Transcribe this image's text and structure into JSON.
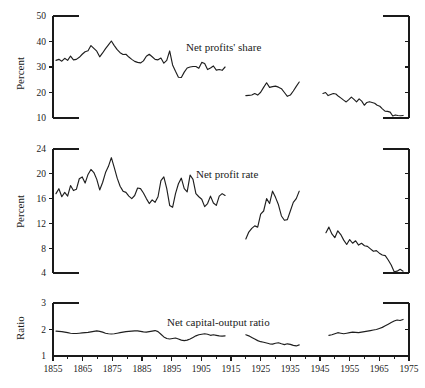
{
  "chart_data": {
    "type": "line",
    "title": "",
    "xlabel": "",
    "xlim": [
      1855,
      1975
    ],
    "x_ticks_major": [
      1855,
      1865,
      1875,
      1885,
      1895,
      1905,
      1915,
      1925,
      1935,
      1945,
      1955,
      1965,
      1975
    ],
    "x_ticks_minor": [
      1860,
      1870,
      1880,
      1890,
      1900,
      1910,
      1920,
      1930,
      1940,
      1950,
      1960,
      1970
    ],
    "grid": false,
    "legend": "inline-annotation",
    "panels": [
      {
        "name": "net-profits-share",
        "label": "Net profits' share",
        "ylabel": "Percent",
        "ylim": [
          10,
          50
        ],
        "y_ticks": [
          10,
          20,
          30,
          40,
          50
        ],
        "segments": [
          {
            "name": "1856-1913",
            "x_start": 1856,
            "x_end": 1913,
            "values": [
              32.6,
              33.0,
              32.3,
              33.4,
              32.6,
              34.3,
              32.8,
              33.0,
              33.8,
              35.0,
              36.0,
              36.4,
              38.4,
              37.3,
              36.2,
              34.0,
              35.5,
              37.2,
              38.7,
              40.2,
              38.4,
              36.8,
              35.6,
              34.9,
              35.0,
              33.9,
              33.0,
              32.2,
              31.8,
              31.6,
              32.4,
              34.2,
              35.0,
              34.0,
              33.0,
              32.8,
              33.5,
              31.5,
              32.6,
              36.3,
              30.8,
              28.3,
              26.0,
              25.9,
              28.0,
              29.6,
              30.0,
              30.2,
              30.2,
              29.5,
              31.8,
              31.4,
              29.0,
              29.6,
              30.4,
              28.8,
              29.0,
              28.7,
              30.0
            ]
          },
          {
            "name": "1920-1938",
            "x_start": 1920,
            "x_end": 1938,
            "values": [
              18.8,
              18.9,
              19.0,
              19.6,
              19.0,
              20.1,
              22.0,
              23.8,
              22.0,
              22.3,
              22.5,
              22.1,
              21.5,
              20.0,
              18.5,
              19.0,
              20.6,
              22.4,
              24.1
            ]
          },
          {
            "name": "1946-1973",
            "x_start": 1946,
            "x_end": 1973,
            "values": [
              19.6,
              20.0,
              18.8,
              19.2,
              19.6,
              19.4,
              18.5,
              17.8,
              17.0,
              16.3,
              17.2,
              18.2,
              17.3,
              16.3,
              17.5,
              16.6,
              15.0,
              16.1,
              16.4,
              16.1,
              15.8,
              15.0,
              14.6,
              13.6,
              12.7,
              12.6,
              12.3,
              10.8,
              11.2,
              11.0,
              10.9,
              11.0
            ]
          }
        ]
      },
      {
        "name": "net-profit-rate",
        "label": "Net profit rate",
        "ylabel": "Percent",
        "ylim": [
          4,
          24
        ],
        "y_ticks": [
          4,
          8,
          12,
          16,
          20,
          24
        ],
        "segments": [
          {
            "name": "1856-1913",
            "x_start": 1856,
            "x_end": 1913,
            "values": [
              16.8,
              17.6,
              16.3,
              17.0,
              16.4,
              18.1,
              17.3,
              17.5,
              19.2,
              19.5,
              18.5,
              19.9,
              20.7,
              20.2,
              19.1,
              17.4,
              18.6,
              20.2,
              21.2,
              22.6,
              21.0,
              19.3,
              18.0,
              17.2,
              17.0,
              16.4,
              16.0,
              16.5,
              17.7,
              17.6,
              16.9,
              16.0,
              15.2,
              15.8,
              15.4,
              16.3,
              18.9,
              19.5,
              17.6,
              14.9,
              14.6,
              16.8,
              18.4,
              19.3,
              17.6,
              17.1,
              19.8,
              19.1,
              16.8,
              16.3,
              15.9,
              14.7,
              15.2,
              16.4,
              15.3,
              14.9,
              16.4,
              16.8,
              16.5
            ]
          },
          {
            "name": "1920-1938",
            "x_start": 1920,
            "x_end": 1938,
            "values": [
              9.5,
              10.6,
              11.2,
              11.6,
              11.4,
              13.5,
              14.0,
              16.0,
              15.2,
              17.2,
              16.2,
              15.0,
              13.2,
              12.5,
              12.6,
              14.0,
              15.4,
              16.0,
              17.2
            ]
          },
          {
            "name": "1947-1973",
            "x_start": 1947,
            "x_end": 1973,
            "values": [
              10.5,
              11.4,
              10.3,
              9.7,
              10.8,
              10.2,
              9.3,
              8.6,
              9.4,
              8.8,
              9.2,
              8.5,
              8.8,
              8.4,
              8.3,
              7.9,
              7.5,
              7.6,
              7.2,
              6.9,
              6.8,
              6.1,
              5.3,
              4.2,
              4.3,
              4.6,
              4.3
            ]
          }
        ]
      },
      {
        "name": "net-capital-output-ratio",
        "label": "Net capital-output ratio",
        "ylabel": "Ratio",
        "ylim": [
          1,
          3
        ],
        "y_ticks": [
          1,
          2,
          3
        ],
        "segments": [
          {
            "name": "1856-1913",
            "x_start": 1856,
            "x_end": 1913,
            "values": [
              1.94,
              1.93,
              1.92,
              1.9,
              1.88,
              1.86,
              1.85,
              1.85,
              1.86,
              1.87,
              1.88,
              1.89,
              1.91,
              1.93,
              1.95,
              1.93,
              1.9,
              1.86,
              1.84,
              1.83,
              1.84,
              1.86,
              1.88,
              1.9,
              1.92,
              1.93,
              1.94,
              1.95,
              1.95,
              1.93,
              1.91,
              1.9,
              1.92,
              1.94,
              1.96,
              1.92,
              1.82,
              1.72,
              1.66,
              1.64,
              1.66,
              1.68,
              1.64,
              1.6,
              1.58,
              1.6,
              1.64,
              1.7,
              1.76,
              1.8,
              1.82,
              1.84,
              1.82,
              1.78,
              1.8,
              1.78,
              1.76,
              1.75,
              1.76
            ]
          },
          {
            "name": "1920-1938",
            "x_start": 1920,
            "x_end": 1938,
            "values": [
              1.8,
              1.76,
              1.7,
              1.64,
              1.58,
              1.54,
              1.52,
              1.49,
              1.46,
              1.45,
              1.48,
              1.5,
              1.46,
              1.43,
              1.46,
              1.44,
              1.4,
              1.38,
              1.42
            ]
          },
          {
            "name": "1948-1973",
            "x_start": 1948,
            "x_end": 1973,
            "values": [
              1.78,
              1.8,
              1.84,
              1.88,
              1.86,
              1.84,
              1.86,
              1.88,
              1.9,
              1.89,
              1.88,
              1.9,
              1.92,
              1.94,
              1.96,
              1.98,
              2.0,
              2.04,
              2.08,
              2.14,
              2.2,
              2.26,
              2.32,
              2.36,
              2.34,
              2.38
            ]
          }
        ]
      }
    ]
  }
}
